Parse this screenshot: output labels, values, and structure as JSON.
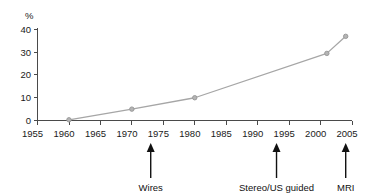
{
  "chart_data": {
    "type": "line",
    "title": "50% cure",
    "xlabel": "",
    "ylabel": "%",
    "x": [
      1960,
      1970,
      1980,
      2001,
      2004
    ],
    "values": [
      0.3,
      5,
      10,
      29.5,
      37
    ],
    "series": [
      {
        "name": "Non-palpable lesions",
        "x": [
          1960,
          1970,
          1980,
          2001,
          2004
        ],
        "values": [
          0.3,
          5,
          10,
          29.5,
          37
        ]
      }
    ],
    "xlim": [
      1955,
      2005
    ],
    "ylim": [
      0,
      40
    ],
    "xticks": [
      1955,
      1960,
      1965,
      1970,
      1975,
      1980,
      1985,
      1990,
      1995,
      2000,
      2005
    ],
    "xtick_labels": [
      "1955",
      "1960",
      "1965",
      "1970",
      "1975",
      "1980",
      "1985",
      "1990",
      "1995",
      "2000",
      "2005"
    ],
    "yticks": [
      0,
      10,
      20,
      30,
      40
    ],
    "ytick_labels": [
      "0",
      "10",
      "20",
      "30",
      "40"
    ],
    "grid": false,
    "legend": "none",
    "line_color": "#a6a6a6",
    "marker_color": "#9a9a9a",
    "axis_color": "#4a4a4a",
    "annotations": [
      {
        "label": "Wires",
        "x": 1973
      },
      {
        "label": "Stereo/US guided",
        "x": 1993
      },
      {
        "label": "MRI",
        "x": 2004
      }
    ]
  },
  "yaxis": {
    "unit_label": "%",
    "labels": {
      "t0": "0",
      "t1": "10",
      "t2": "20",
      "t3": "30",
      "t4": "40"
    }
  },
  "xaxis": {
    "labels": {
      "t0": "1955",
      "t1": "1960",
      "t2": "1965",
      "t3": "1970",
      "t4": "1975",
      "t5": "1980",
      "t6": "1985",
      "t7": "1990",
      "t8": "1995",
      "t9": "2000",
      "t10": "2005"
    }
  },
  "annotations": {
    "a0": "Wires",
    "a1": "Stereo/US guided",
    "a2": "MRI"
  }
}
